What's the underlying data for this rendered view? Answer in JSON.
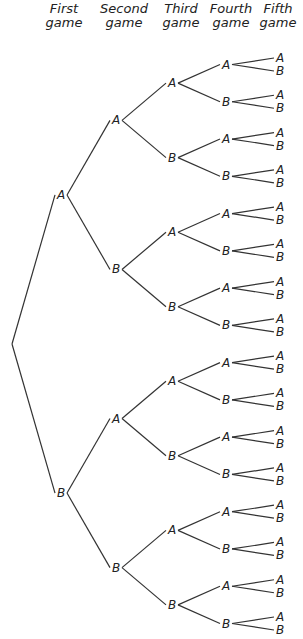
{
  "headers": [
    {
      "line1": "First",
      "line2": "game"
    },
    {
      "line1": "Second",
      "line2": "game"
    },
    {
      "line1": "Third",
      "line2": "game"
    },
    {
      "line1": "Fourth",
      "line2": "game"
    },
    {
      "line1": "Fifth",
      "line2": "game"
    }
  ],
  "tree": {
    "levels": 5,
    "outcomes": [
      "A",
      "B"
    ],
    "description": "Binary tree of outcomes for five games, each game won by A or B"
  }
}
